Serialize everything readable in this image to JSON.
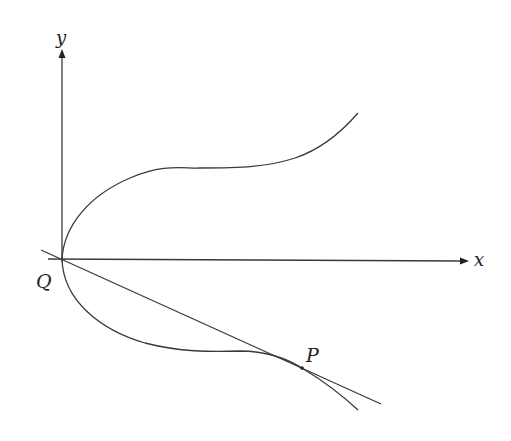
{
  "diagram": {
    "axes": {
      "x_label": "x",
      "y_label": "y"
    },
    "points": {
      "origin_label": "Q",
      "tangent_point_label": "P"
    },
    "elements": [
      "x-axis with arrow",
      "y-axis with arrow",
      "curve branch above x-axis from Q",
      "curve branch below x-axis from Q through P",
      "straight line through Q tangent to curve at P"
    ],
    "colors": {
      "stroke": "#3a3a3a",
      "background": "#ffffff"
    }
  }
}
